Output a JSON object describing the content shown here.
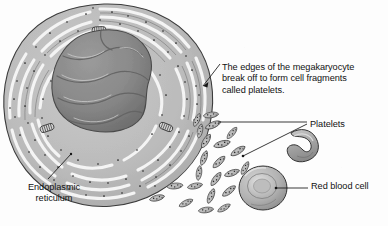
{
  "figure": {
    "background_color": "#fdfdfd",
    "ink_color": "#121212",
    "width": 388,
    "height": 226
  },
  "labels": {
    "callout": "The edges of the megakaryocyte\nbreak off to form cell fragments\ncalled platelets.",
    "platelets": "Platelets",
    "red_blood_cell": "Red blood cell",
    "endoplasmic_reticulum": "Endoplasmic reticulum"
  },
  "structures": {
    "megakaryocyte": {
      "name": "megakaryocyte",
      "cytoplasm_color": "#b9b9b9",
      "outline_color": "#3c3c3c",
      "nucleus": {
        "name": "multi-lobed nucleus",
        "fill_color": "#8e8e8e",
        "shade_color": "#6f6f6f"
      },
      "endoplasmic_reticulum_color": "#f2f2f2",
      "ribosome_color": "#1e1e1e",
      "mitochondria_count": 3,
      "mitochondria_color": "#cfcfcf"
    },
    "platelets": {
      "name": "platelets",
      "count": 22,
      "fill_color": "#c4c4c4",
      "outline_color": "#3a3a3a"
    },
    "red_blood_cells": {
      "name": "red blood cells",
      "count": 2,
      "views": [
        "side-view-crescent",
        "face-view-biconcave-disc"
      ],
      "fill_color": "#b5b5b5",
      "outline_color": "#3a3a3a",
      "highlight_color": "#d8d8d8"
    }
  },
  "leaders": {
    "callout_leader": {
      "name": "callout-leader-line",
      "arrowhead": true
    },
    "platelets_leader_upper": {
      "name": "platelets-leader-upper",
      "arrowhead": false
    },
    "platelets_leader_lower": {
      "name": "platelets-leader-lower",
      "arrowhead": false
    },
    "rbc_leader": {
      "name": "red-blood-cell-leader",
      "arrowhead": false
    },
    "er_leader": {
      "name": "endoplasmic-reticulum-leader",
      "arrowhead": false
    }
  }
}
